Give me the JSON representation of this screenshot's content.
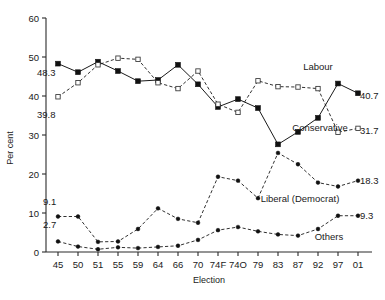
{
  "chart_data": {
    "type": "line",
    "title": "",
    "xlabel": "Election",
    "ylabel": "Per cent",
    "ylim": [
      0,
      60
    ],
    "yticks": [
      0,
      10,
      20,
      30,
      40,
      50,
      60
    ],
    "grid": false,
    "legend": "inline-annotations",
    "categories": [
      "45",
      "50",
      "51",
      "55",
      "59",
      "64",
      "66",
      "70",
      "74F",
      "74O",
      "79",
      "83",
      "87",
      "92",
      "97",
      "01"
    ],
    "series": [
      {
        "name": "Labour",
        "marker": "filled-square",
        "line": "solid",
        "values": [
          48.3,
          46.1,
          48.8,
          46.4,
          43.8,
          44.1,
          48.0,
          43.0,
          37.2,
          39.2,
          36.9,
          27.6,
          30.8,
          34.4,
          43.2,
          40.7
        ],
        "start_label": "48.3",
        "end_label": "40.7"
      },
      {
        "name": "Conservative",
        "marker": "open-square",
        "line": "dashed",
        "values": [
          39.8,
          43.4,
          48.0,
          49.7,
          49.4,
          43.4,
          41.9,
          46.4,
          37.9,
          35.8,
          43.9,
          42.4,
          42.3,
          41.9,
          30.7,
          31.7
        ],
        "start_label": "39.8",
        "end_label": "31.7"
      },
      {
        "name": "Liberal (Democrat)",
        "marker": "filled-dot",
        "line": "dashed",
        "values": [
          9.1,
          9.1,
          2.6,
          2.7,
          5.9,
          11.2,
          8.5,
          7.5,
          19.3,
          18.3,
          13.8,
          25.4,
          22.5,
          17.8,
          16.8,
          18.3
        ],
        "start_label": "9.1",
        "end_label": "18.3"
      },
      {
        "name": "Others",
        "marker": "filled-dot",
        "line": "dashed",
        "values": [
          2.7,
          1.4,
          0.7,
          1.2,
          1.0,
          1.3,
          1.6,
          3.1,
          5.6,
          6.4,
          5.3,
          4.5,
          4.2,
          5.9,
          9.3,
          9.3
        ],
        "start_label": "2.7",
        "end_label": "9.3"
      }
    ],
    "annotations": [
      {
        "text": "Labour",
        "at": "top-right"
      },
      {
        "text": "Conservative",
        "at": "mid-right"
      },
      {
        "text": "Liberal (Democrat)",
        "at": "lower-right"
      },
      {
        "text": "Others",
        "at": "bottom-right"
      }
    ]
  }
}
